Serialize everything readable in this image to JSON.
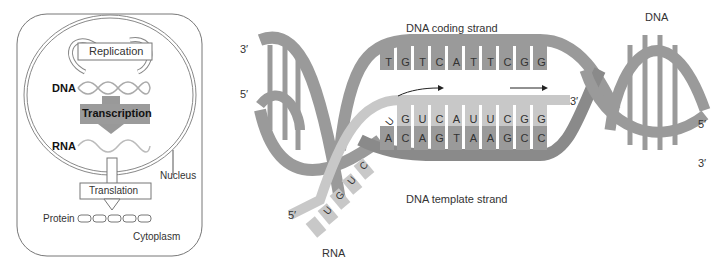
{
  "left_panel": {
    "replication_label": "Replication",
    "dna_label": "DNA",
    "transcription_label": "Transcription",
    "rna_label": "RNA",
    "translation_label": "Translation",
    "protein_label": "Protein",
    "nucleus_label": "Nucleus",
    "cytoplasm_label": "Cytoplasm"
  },
  "right_panel": {
    "coding_strand_label": "DNA coding strand",
    "template_strand_label": "DNA template strand",
    "dna_label": "DNA",
    "rna_label": "RNA",
    "coding_bases": [
      "T",
      "G",
      "T",
      "C",
      "A",
      "T",
      "T",
      "C",
      "G",
      "G"
    ],
    "rna_bases_top": [
      "G",
      "U",
      "C",
      "A",
      "U",
      "U",
      "C",
      "G",
      "G"
    ],
    "template_bases": [
      "A",
      "C",
      "A",
      "G",
      "T",
      "A",
      "A",
      "G",
      "C",
      "C"
    ],
    "rna_bases_tail": [
      "U",
      "C",
      "U",
      "G",
      "U"
    ],
    "end_labels": {
      "left_top": "3′",
      "left_mid": "5′",
      "rna_3prime": "3′",
      "right_mid": "5′",
      "right_bottom": "3′",
      "rna_5prime": "5′"
    }
  },
  "colors": {
    "dna_strand": "#9a9a9a",
    "dna_strand_dark": "#8a8a8a",
    "rna_strand": "#c8c8c8",
    "transcription_box": "#9b9b9b",
    "outline": "#666666"
  }
}
